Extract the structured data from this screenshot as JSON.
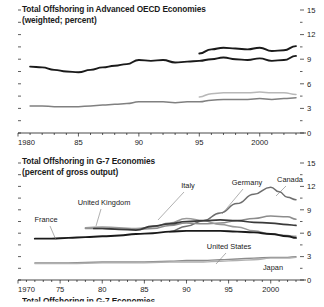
{
  "figure": {
    "background": "#ffffff",
    "text_color": "#1a1a1a"
  },
  "panels": [
    {
      "id": "advanced-oecd",
      "title": "Total Offshoring in Advanced OECD Economies",
      "subtitle": "(weighted; percent)"
    },
    {
      "id": "g7",
      "title": "Total Offshoring in G-7 Economies",
      "subtitle": "(percent of gross output)"
    }
  ],
  "cutoff_panel": {
    "title": "Total Offshoring in G-7 Economies"
  },
  "chart_data": [
    {
      "type": "line",
      "id": "advanced-oecd",
      "title": "Total Offshoring in Advanced OECD Economies",
      "subtitle": "(weighted; percent)",
      "xlabel": "",
      "ylabel": "",
      "xlim": [
        1980,
        2003
      ],
      "ylim": [
        0,
        15
      ],
      "yticks": [
        0,
        3,
        6,
        9,
        12,
        15
      ],
      "ytick_labels": [
        "0",
        "3",
        "6",
        "9",
        "12",
        "15"
      ],
      "y_minor_interval": 1.5,
      "xticks": [
        1980,
        1985,
        1990,
        1995,
        2000
      ],
      "xtick_labels": [
        "1980",
        "85",
        "90",
        "95",
        "2000"
      ],
      "x_minor_interval": 1,
      "axis_position": "right",
      "grid": false,
      "legend": "none",
      "series": [
        {
          "name": "total-offshoring-dark-upper",
          "color": "#1a1a1a",
          "width": 1.9,
          "x": [
            1981,
            1982,
            1983,
            1984,
            1985,
            1986,
            1987,
            1988,
            1989,
            1990,
            1991,
            1992,
            1993,
            1994,
            1995,
            1996,
            1997,
            1998,
            1999,
            2000,
            2001,
            2002,
            2003
          ],
          "values": [
            8.1,
            8.0,
            7.7,
            7.5,
            7.4,
            7.7,
            8.0,
            8.2,
            8.4,
            8.9,
            8.8,
            8.9,
            8.6,
            8.7,
            8.8,
            9.0,
            9.2,
            9.0,
            8.9,
            9.1,
            8.8,
            8.9,
            9.4
          ]
        },
        {
          "name": "total-offshoring-dark-1995-start",
          "color": "#1a1a1a",
          "width": 1.9,
          "x": [
            1995,
            1996,
            1997,
            1998,
            1999,
            2000,
            2001,
            2002,
            2003
          ],
          "values": [
            9.7,
            10.2,
            10.4,
            10.3,
            10.2,
            10.4,
            10.0,
            10.1,
            10.6
          ]
        },
        {
          "name": "total-offshoring-gray-lower",
          "color": "#808080",
          "width": 1.5,
          "x": [
            1981,
            1982,
            1983,
            1984,
            1985,
            1986,
            1987,
            1988,
            1989,
            1990,
            1991,
            1992,
            1993,
            1994,
            1995,
            1996,
            1997,
            1998,
            1999,
            2000,
            2001,
            2002,
            2003
          ],
          "values": [
            3.3,
            3.3,
            3.2,
            3.2,
            3.2,
            3.3,
            3.4,
            3.5,
            3.6,
            3.8,
            3.8,
            3.8,
            3.7,
            3.8,
            3.8,
            4.0,
            4.1,
            4.1,
            4.1,
            4.2,
            4.1,
            4.2,
            4.3
          ]
        },
        {
          "name": "total-offshoring-lightgray-1995-start",
          "color": "#b8b8b8",
          "width": 1.5,
          "x": [
            1995,
            1996,
            1997,
            1998,
            1999,
            2000,
            2001,
            2002,
            2003
          ],
          "values": [
            4.4,
            4.8,
            4.9,
            4.9,
            4.9,
            5.0,
            4.9,
            4.9,
            4.7
          ]
        }
      ]
    },
    {
      "type": "line",
      "id": "g7",
      "title": "Total Offshoring in G-7 Economies",
      "subtitle": "(percent of gross output)",
      "xlabel": "",
      "ylabel": "",
      "xlim": [
        1970,
        2003
      ],
      "ylim": [
        0,
        15
      ],
      "yticks": [
        0,
        3,
        6,
        9,
        12,
        15
      ],
      "ytick_labels": [
        "0",
        "3",
        "6",
        "9",
        "12",
        "15"
      ],
      "y_minor_interval": 1.5,
      "xticks": [
        1970,
        1975,
        1980,
        1985,
        1990,
        1995,
        2000
      ],
      "xtick_labels": [
        "1970",
        "75",
        "80",
        "85",
        "90",
        "95",
        "2000"
      ],
      "x_minor_interval": 1,
      "axis_position": "right",
      "grid": false,
      "legend": "inline-annotations",
      "series": [
        {
          "name": "Canada",
          "color": "#6e6e6e",
          "width": 1.5,
          "label": "Canada",
          "x": [
            1988,
            1990,
            1992,
            1994,
            1996,
            1998,
            2000,
            2001,
            2002,
            2003
          ],
          "values": [
            6.2,
            6.9,
            7.6,
            8.6,
            9.8,
            11.0,
            11.9,
            11.3,
            10.6,
            10.3
          ]
        },
        {
          "name": "Germany",
          "color": "#8c8c8c",
          "width": 1.5,
          "label": "Germany",
          "x": [
            1978,
            1980,
            1982,
            1984,
            1986,
            1988,
            1990,
            1992,
            1994,
            1996,
            1998,
            2000,
            2002,
            2003
          ],
          "values": [
            6.6,
            6.6,
            6.5,
            6.5,
            6.6,
            7.0,
            7.3,
            7.2,
            7.3,
            7.6,
            7.9,
            8.2,
            8.1,
            7.8
          ]
        },
        {
          "name": "Italy",
          "color": "#9a9a9a",
          "width": 1.5,
          "label": "Italy",
          "x": [
            1978,
            1980,
            1982,
            1984,
            1986,
            1988,
            1990,
            1992,
            1994,
            1996,
            1998,
            2000,
            2002,
            2003
          ],
          "values": [
            6.7,
            6.8,
            6.7,
            6.6,
            6.8,
            7.3,
            7.9,
            7.6,
            7.1,
            6.8,
            6.3,
            5.9,
            5.7,
            5.6
          ]
        },
        {
          "name": "United Kingdom",
          "color": "#3a3a3a",
          "width": 1.7,
          "label": "United Kingdom",
          "x": [
            1979,
            1980,
            1982,
            1984,
            1986,
            1988,
            1990,
            1992,
            1994,
            1996,
            1998,
            2000,
            2002,
            2003
          ],
          "values": [
            6.6,
            6.6,
            6.5,
            6.4,
            6.9,
            7.2,
            7.5,
            7.6,
            7.7,
            7.6,
            7.4,
            7.3,
            7.1,
            7.0
          ]
        },
        {
          "name": "France",
          "color": "#1a1a1a",
          "width": 1.9,
          "label": "France",
          "x": [
            1972,
            1974,
            1976,
            1978,
            1980,
            1982,
            1984,
            1986,
            1988,
            1990,
            1992,
            1994,
            1996,
            1998,
            2000,
            2002,
            2003
          ],
          "values": [
            5.3,
            5.3,
            5.4,
            5.5,
            5.6,
            5.7,
            5.9,
            6.0,
            6.2,
            6.3,
            6.3,
            6.3,
            6.2,
            6.1,
            5.9,
            5.6,
            5.4
          ]
        },
        {
          "name": "United States",
          "color": "#8c8c8c",
          "width": 1.4,
          "label": "United States",
          "x": [
            1972,
            1976,
            1980,
            1984,
            1988,
            1990,
            1992,
            1994,
            1996,
            1998,
            2000,
            2002,
            2003
          ],
          "values": [
            2.2,
            2.2,
            2.3,
            2.3,
            2.4,
            2.5,
            2.5,
            2.6,
            2.7,
            2.8,
            2.9,
            2.9,
            3.0
          ]
        },
        {
          "name": "Japan",
          "color": "#b0b0b0",
          "width": 1.4,
          "label": "Japan",
          "x": [
            1972,
            1976,
            1980,
            1984,
            1988,
            1992,
            1994,
            1996,
            1998,
            2000,
            2002,
            2003
          ],
          "values": [
            2.1,
            2.1,
            2.2,
            2.2,
            2.3,
            2.3,
            2.4,
            2.5,
            2.6,
            2.8,
            2.8,
            2.9
          ]
        }
      ],
      "annotations": [
        {
          "label": "Italy",
          "x": 188,
          "y": 36,
          "leader": [
            [
              184,
              40
            ],
            [
              158,
              68
            ]
          ]
        },
        {
          "label": "Germany",
          "x": 247,
          "y": 33,
          "leader": [
            [
              243,
              37
            ],
            [
              222,
              62
            ]
          ]
        },
        {
          "label": "Canada",
          "x": 290,
          "y": 30,
          "leader": [
            [
              286,
              34
            ],
            [
              276,
              44
            ]
          ]
        },
        {
          "label": "United Kingdom",
          "x": 104,
          "y": 53,
          "leader": [
            [
              101,
              57
            ],
            [
              96,
              74
            ]
          ]
        },
        {
          "label": "France",
          "x": 46,
          "y": 70,
          "leader": [
            [
              50,
              74
            ],
            [
              56,
              88
            ]
          ]
        },
        {
          "label": "United States",
          "x": 229,
          "y": 97,
          "leader": [
            [
              226,
              101
            ],
            [
              216,
              112
            ]
          ]
        },
        {
          "label": "Japan",
          "x": 273,
          "y": 118,
          "leader": null
        }
      ]
    }
  ]
}
